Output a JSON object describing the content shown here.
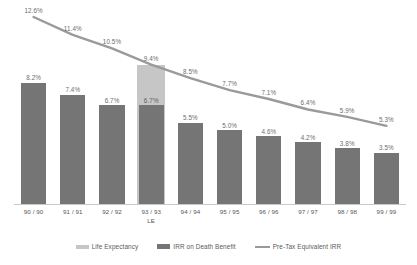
{
  "chart_data": {
    "type": "bar",
    "title": "",
    "xlabel": "",
    "ylabel": "",
    "ylim": [
      0,
      13.2
    ],
    "grid": false,
    "legend_position": "bottom",
    "categories": [
      "90 / 90",
      "91 / 91",
      "92 / 92",
      "93 / 93",
      "94 / 94",
      "95 / 95",
      "96 / 96",
      "97 / 97",
      "98 / 98",
      "99 / 99"
    ],
    "category_sublabels": [
      "",
      "",
      "",
      "LE",
      "",
      "",
      "",
      "",
      "",
      ""
    ],
    "series": [
      {
        "name": "Life Expectancy",
        "type": "bar",
        "color": "#c6c6c6",
        "values": [
          null,
          null,
          null,
          9.4,
          null,
          null,
          null,
          null,
          null,
          null
        ],
        "labels": [
          "",
          "",
          "",
          "9.4%",
          "",
          "",
          "",
          "",
          "",
          ""
        ]
      },
      {
        "name": "IRR on Death Benefit",
        "type": "bar",
        "color": "#757575",
        "values": [
          8.2,
          7.4,
          6.7,
          6.7,
          5.5,
          5.0,
          4.6,
          4.2,
          3.8,
          3.5
        ],
        "labels": [
          "8.2%",
          "7.4%",
          "6.7%",
          "6.7%",
          "5.5%",
          "5.0%",
          "4.6%",
          "4.2%",
          "3.8%",
          "3.5%"
        ]
      },
      {
        "name": "Pre-Tax Equivalent IRR",
        "type": "line",
        "color": "#9a9a9a",
        "values": [
          12.6,
          11.4,
          10.5,
          9.4,
          8.5,
          7.7,
          7.1,
          6.4,
          5.9,
          5.3
        ],
        "labels": [
          "12.6%",
          "11.4%",
          "10.5%",
          "9.4%",
          "8.5%",
          "7.7%",
          "7.1%",
          "6.4%",
          "5.9%",
          "5.3%"
        ]
      }
    ]
  },
  "legend": {
    "items": [
      {
        "label": "Life Expectancy",
        "swatch": "bar-light",
        "color": "#c6c6c6"
      },
      {
        "label": "IRR on Death Benefit",
        "swatch": "bar-dark",
        "color": "#757575"
      },
      {
        "label": "Pre-Tax Equivalent IRR",
        "swatch": "line",
        "color": "#9a9a9a"
      }
    ]
  }
}
